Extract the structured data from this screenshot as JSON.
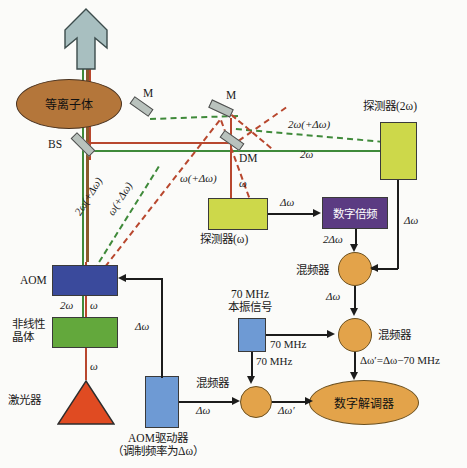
{
  "diagram": {
    "components": {
      "plasma": {
        "label": "等离子体",
        "color": "#b4763a"
      },
      "laser": {
        "label": "激光器",
        "color": "#e04b22"
      },
      "nonlinear_crystal": {
        "label": "非线性\n晶体",
        "line1": "非线性",
        "line2": "晶体",
        "color": "#63a83c"
      },
      "aom": {
        "label": "AOM",
        "color": "#3a4a9c"
      },
      "aom_driver": {
        "line1": "AOM驱动器",
        "line2": "（调制频率为Δω）",
        "color": "#6e9ad4"
      },
      "detector_2w": {
        "label": "探测器(2ω)",
        "color": "#cdd84a"
      },
      "detector_w": {
        "label": "探测器(ω)",
        "color": "#cdd84a"
      },
      "digital_doubler": {
        "label": "数字倍频",
        "color": "#5b3b82"
      },
      "local_osc": {
        "line1": "70 MHz",
        "line2": "本振信号",
        "color": "#6e9ad4"
      },
      "mixer_top": {
        "label": "混频器",
        "color": "#e3a34a"
      },
      "mixer_mid": {
        "label": "混频器",
        "color": "#e3a34a"
      },
      "mixer_bottom": {
        "label": "混频器",
        "color": "#e3a34a"
      },
      "digital_demodulator": {
        "label": "数字解调器",
        "color": "#e3a34a"
      },
      "beam_splitter": {
        "label": "BS"
      },
      "mirror_1": {
        "label": "M"
      },
      "mirror_2": {
        "label": "M"
      },
      "dichroic_mirror": {
        "label": "DM"
      },
      "output_arrow": {
        "color": "#a8bfc0"
      }
    },
    "beam_labels": {
      "two_omega_delta_left": "2ω(+Δω)",
      "omega_delta_left": "ω(+Δω)",
      "omega_delta_right": "ω(+Δω)",
      "two_omega_delta_top": "2ω(+Δω)",
      "two_omega_right": "2ω",
      "omega_dm": "ω",
      "two_omega_crystal": "2ω",
      "omega_crystal": "ω",
      "omega_laser": "ω"
    },
    "signal_labels": {
      "det_w_to_doubler": "Δω",
      "doubler_to_mixer": "2Δω",
      "det_2w_to_mixer": "Δω",
      "mixer_top_to_mid": "Δω",
      "lo_to_mixer_mid": "70 MHz",
      "lo_to_mixer_bottom": "70 MHz",
      "mixer_mid_out": "Δω′=Δω−70 MHz",
      "driver_to_mixer_bottom": "Δω",
      "mixer_bottom_out": "Δω′",
      "driver_to_aom": "Δω"
    }
  }
}
